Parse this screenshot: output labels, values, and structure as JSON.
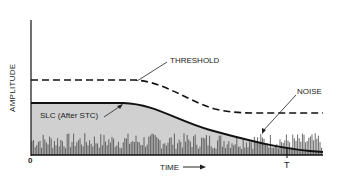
{
  "diagram": {
    "type": "radar-signal-timing",
    "axes": {
      "y_label": "AMPLITUDE",
      "x_label": "TIME",
      "x_origin_label": "0",
      "x_end_marker": "T"
    },
    "curves": [
      {
        "name": "threshold",
        "label": "THRESHOLD",
        "style": "dashed"
      },
      {
        "name": "slc",
        "label": "SLC (After STC)",
        "style": "solid",
        "fill": "#cfcfcf"
      },
      {
        "name": "noise",
        "label": "NOISE",
        "style": "spikes"
      }
    ],
    "colors": {
      "line": "#111111",
      "fill": "#d0d0d0",
      "noise": "#444444",
      "background": "#ffffff"
    }
  }
}
